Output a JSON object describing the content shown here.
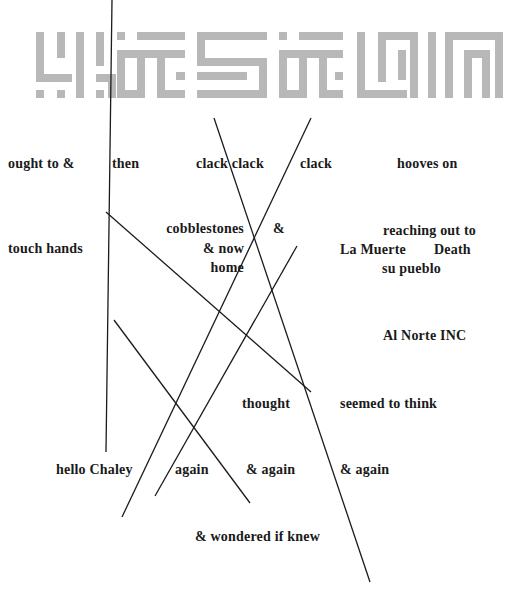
{
  "banner": {
    "icon": "kufic-calligraphy-banner",
    "color": "#b8b8b8"
  },
  "phrases": {
    "ought_to": "ought to &",
    "then": "then",
    "clack1": "clack clack",
    "clack2": "clack",
    "hooves": "hooves on",
    "touch_hands": "touch hands",
    "cobblestones": "cobblestones",
    "and_now": "& now",
    "home": "home",
    "amp": "&",
    "reaching": "reaching out to",
    "la_muerte": "La Muerte",
    "death": "Death",
    "su_pueblo": "su pueblo",
    "al_norte": "Al Norte INC",
    "thought": "thought",
    "seemed": "seemed to think",
    "hello": "hello Chaley",
    "again1": "again",
    "again2": "& again",
    "again3": "& again",
    "wondered": "& wondered if knew"
  },
  "colors": {
    "text": "#1a1a1a",
    "lines": "#1b1b1b",
    "background": "#ffffff"
  }
}
